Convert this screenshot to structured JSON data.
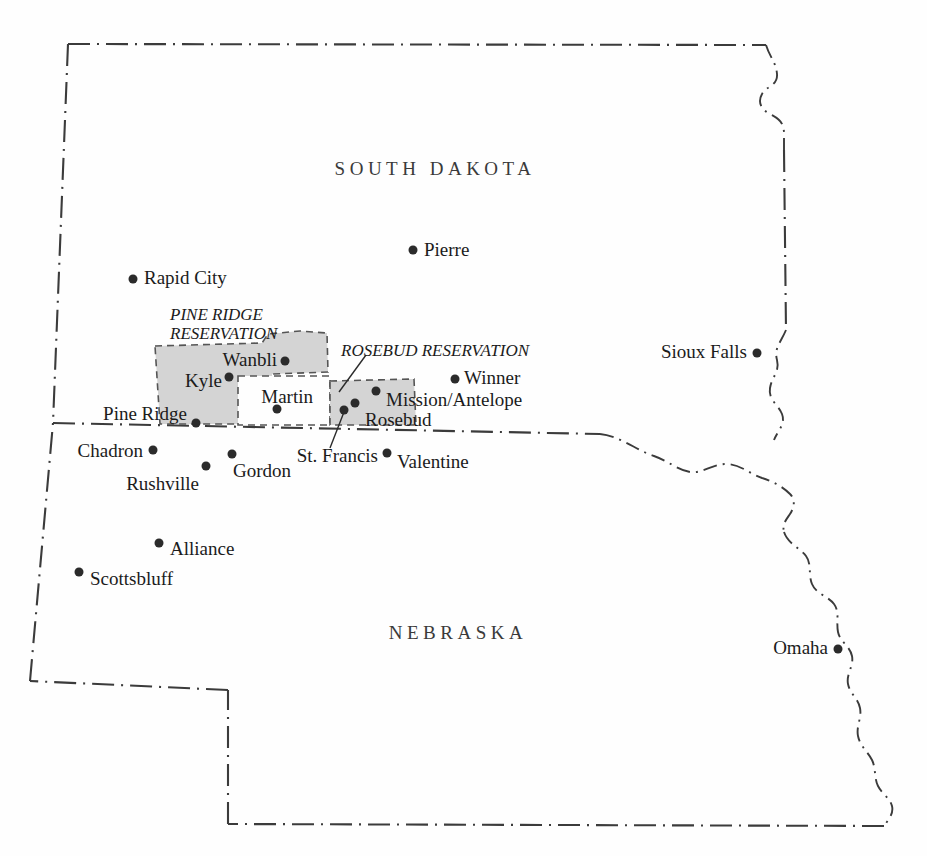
{
  "map": {
    "title": "Pine Ridge and Rosebud Reservations, South Dakota and Nebraska",
    "colors": {
      "paper": "#fefefe",
      "border_line": "#3b3b3b",
      "reservation_fill": "#d4d4d4",
      "reservation_outline": "#555555",
      "city_dot": "#2b2b2b",
      "text": "#1b1b1b",
      "state_label_text": "#3a3a3a"
    },
    "states": [
      {
        "name": "SOUTH DAKOTA",
        "x": 435,
        "y": 169
      },
      {
        "name": "NEBRASKA",
        "x": 458,
        "y": 633
      }
    ],
    "reservations": [
      {
        "name": "PINE RIDGE\nRESERVATION",
        "label_x": 170,
        "label_y": 305,
        "has_leader": false
      },
      {
        "name": "ROSEBUD RESERVATION",
        "label_x": 341,
        "label_y": 341,
        "has_leader": true
      }
    ],
    "cities": [
      {
        "name": "Pierre",
        "dot_x": 413,
        "dot_y": 250,
        "label_x": 424,
        "label_y": 249,
        "anchor": "left"
      },
      {
        "name": "Rapid City",
        "dot_x": 133,
        "dot_y": 279,
        "label_x": 144,
        "label_y": 277,
        "anchor": "left"
      },
      {
        "name": "Sioux Falls",
        "dot_x": 757,
        "dot_y": 353,
        "label_x": 747,
        "label_y": 351,
        "anchor": "right"
      },
      {
        "name": "Wanbli",
        "dot_x": 285,
        "dot_y": 361,
        "label_x": 277,
        "label_y": 359,
        "anchor": "right"
      },
      {
        "name": "Winner",
        "dot_x": 455,
        "dot_y": 379,
        "label_x": 464,
        "label_y": 377,
        "anchor": "left"
      },
      {
        "name": "Kyle",
        "dot_x": 229,
        "dot_y": 377,
        "label_x": 222,
        "label_y": 380,
        "anchor": "right"
      },
      {
        "name": "Mission/Antelope",
        "dot_x": 376,
        "dot_y": 391,
        "label_x": 386,
        "label_y": 399,
        "anchor": "left"
      },
      {
        "name": "Martin",
        "dot_x": 277,
        "dot_y": 409,
        "label_x": 277,
        "label_y": 396,
        "anchor": "center"
      },
      {
        "name": "Rosebud",
        "dot_x": 355,
        "dot_y": 403,
        "label_x": 365,
        "label_y": 419,
        "anchor": "left"
      },
      {
        "name": "St. Francis",
        "dot_x": 344,
        "dot_y": 410,
        "label_x": 332,
        "label_y": 455,
        "anchor": "right"
      },
      {
        "name": "Pine Ridge",
        "dot_x": 196,
        "dot_y": 423,
        "label_x": 187,
        "label_y": 413,
        "anchor": "right"
      },
      {
        "name": "Chadron",
        "dot_x": 153,
        "dot_y": 450,
        "label_x": 143,
        "label_y": 450,
        "anchor": "right"
      },
      {
        "name": "Valentine",
        "dot_x": 387,
        "dot_y": 453,
        "label_x": 397,
        "label_y": 461,
        "anchor": "left"
      },
      {
        "name": "Gordon",
        "dot_x": 232,
        "dot_y": 454,
        "label_x": 233,
        "label_y": 470,
        "anchor": "left"
      },
      {
        "name": "Rushville",
        "dot_x": 206,
        "dot_y": 466,
        "label_x": 199,
        "label_y": 483,
        "anchor": "right"
      },
      {
        "name": "Alliance",
        "dot_x": 159,
        "dot_y": 543,
        "label_x": 170,
        "label_y": 548,
        "anchor": "left"
      },
      {
        "name": "Scottsbluff",
        "dot_x": 79,
        "dot_y": 572,
        "label_x": 90,
        "label_y": 578,
        "anchor": "left"
      },
      {
        "name": "Omaha",
        "dot_x": 838,
        "dot_y": 649,
        "label_x": 828,
        "label_y": 647,
        "anchor": "right"
      }
    ],
    "borders": {
      "south_dakota_outline": "M 68,44 L 765,45",
      "nebraska_outline": "M 53,423 L 600,434",
      "line_style": "dash-dot"
    }
  }
}
